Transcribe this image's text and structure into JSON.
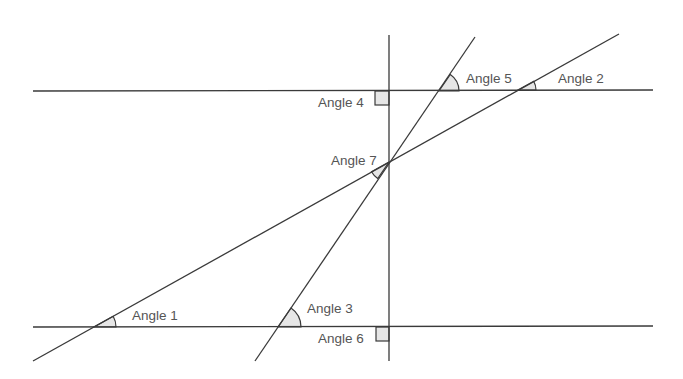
{
  "diagram": {
    "type": "geometry-angles",
    "colors": {
      "line": "#3a3a3a",
      "angle_fill": "#e6e6e6",
      "label": "#555555",
      "background": "#ffffff"
    },
    "lines": [
      {
        "id": "top-horizontal",
        "x1": 33,
        "y1": 91,
        "x2": 653,
        "y2": 90
      },
      {
        "id": "bottom-horizontal",
        "x1": 33,
        "y1": 327,
        "x2": 653,
        "y2": 326
      },
      {
        "id": "vertical-transversal",
        "x1": 389,
        "y1": 35,
        "x2": 389,
        "y2": 361
      },
      {
        "id": "long-diagonal",
        "x1": 33,
        "y1": 361,
        "x2": 619,
        "y2": 34
      },
      {
        "id": "steep-diagonal",
        "x1": 255,
        "y1": 361,
        "x2": 475,
        "y2": 37
      }
    ],
    "angles": [
      {
        "label": "Angle 1",
        "kind": "arc"
      },
      {
        "label": "Angle 2",
        "kind": "arc"
      },
      {
        "label": "Angle 3",
        "kind": "arc"
      },
      {
        "label": "Angle 4",
        "kind": "right-angle"
      },
      {
        "label": "Angle 5",
        "kind": "arc"
      },
      {
        "label": "Angle 6",
        "kind": "right-angle"
      },
      {
        "label": "Angle 7",
        "kind": "arc"
      }
    ]
  }
}
